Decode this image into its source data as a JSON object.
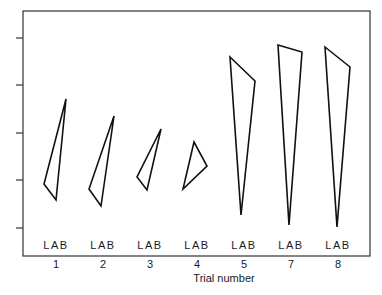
{
  "chart_data": {
    "type": "scatter",
    "subtype": "triangle-plot",
    "title": "",
    "xlabel": "Trial number",
    "ylabel": "",
    "categories": [
      "1",
      "2",
      "3",
      "4",
      "5",
      "7",
      "8"
    ],
    "vertex_labels": "LAB",
    "y_ticks_count": 5,
    "y_tick_labels": [],
    "grid": false,
    "legend": null,
    "plot_frame_px": {
      "left": 23,
      "top": 11,
      "right": 370,
      "bottom": 256
    },
    "y_tick_positions_px": [
      38,
      85,
      133,
      180,
      228
    ],
    "series": [
      {
        "name": "Trial 1",
        "triangle_px": [
          [
            66,
            99
          ],
          [
            44,
            184
          ],
          [
            56,
            200
          ]
        ]
      },
      {
        "name": "Trial 2",
        "triangle_px": [
          [
            114,
            116
          ],
          [
            89,
            189
          ],
          [
            101,
            206
          ]
        ]
      },
      {
        "name": "Trial 3",
        "triangle_px": [
          [
            161,
            129
          ],
          [
            137,
            177
          ],
          [
            147,
            190
          ]
        ]
      },
      {
        "name": "Trial 4",
        "triangle_px": [
          [
            194,
            142
          ],
          [
            207,
            166
          ],
          [
            183,
            189
          ]
        ]
      },
      {
        "name": "Trial 5",
        "triangle_px": [
          [
            230,
            57
          ],
          [
            255,
            81
          ],
          [
            241,
            215
          ]
        ]
      },
      {
        "name": "Trial 7",
        "triangle_px": [
          [
            278,
            45
          ],
          [
            302,
            52
          ],
          [
            289,
            225
          ]
        ]
      },
      {
        "name": "Trial 8",
        "triangle_px": [
          [
            325,
            47
          ],
          [
            350,
            67
          ],
          [
            337,
            227
          ]
        ]
      }
    ],
    "category_x_px": [
      56,
      103,
      150,
      197,
      244,
      291,
      338
    ],
    "lab_label_y_px": 249,
    "tick_label_y_px": 268,
    "xlabel_pos_px": [
      224,
      282
    ]
  },
  "style": {
    "line_color": "#111111",
    "frame_color": "#333333",
    "background": "#ffffff"
  }
}
